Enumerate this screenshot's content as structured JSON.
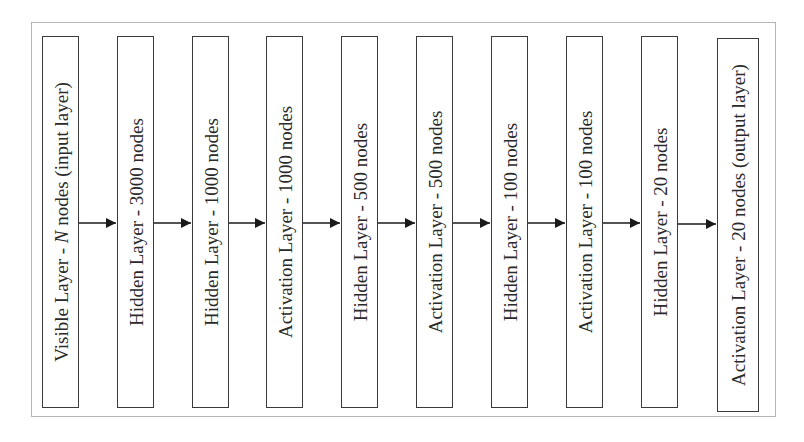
{
  "diagram": {
    "type": "neural-network-architecture",
    "direction": "left-to-right",
    "layers": [
      {
        "label_pre": "Visible Layer - ",
        "label_var": "N",
        "label_post": " nodes (input layer)"
      },
      {
        "label": "Hidden Layer - 3000 nodes"
      },
      {
        "label": "Hidden Layer - 1000 nodes"
      },
      {
        "label": "Activation Layer - 1000 nodes"
      },
      {
        "label": "Hidden Layer - 500 nodes"
      },
      {
        "label": "Activation Layer - 500 nodes"
      },
      {
        "label": "Hidden Layer - 100 nodes"
      },
      {
        "label": "Activation Layer - 100 nodes"
      },
      {
        "label": "Hidden Layer - 20 nodes"
      },
      {
        "label": "Activation Layer - 20 nodes (output layer)"
      }
    ],
    "colors": {
      "frame_border": "#b5b5b5",
      "box_border": "#3a3a3a",
      "arrow": "#1a1a1a",
      "text": "#2a2a2a",
      "background": "#ffffff"
    }
  }
}
